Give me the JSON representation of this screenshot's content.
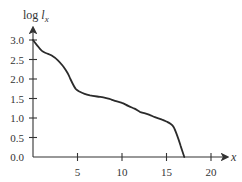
{
  "chart_data": {
    "type": "line",
    "title": "",
    "xlabel": "x",
    "ylabel": "log l_x",
    "ylabel_parts": {
      "prefix": "log ",
      "var": "l",
      "sub": "x"
    },
    "xlim": [
      0,
      20
    ],
    "ylim": [
      0.0,
      3.0
    ],
    "grid": false,
    "legend": null,
    "x_ticks": [
      5,
      10,
      15,
      20
    ],
    "x_tick_labels": [
      "5",
      "10",
      "15",
      "20"
    ],
    "y_ticks": [
      0.0,
      0.5,
      1.0,
      1.5,
      2.0,
      2.5,
      3.0
    ],
    "y_tick_labels": [
      "0.0",
      "0.5",
      "1.0",
      "1.5",
      "2.0",
      "2.5",
      "3.0"
    ],
    "series": [
      {
        "name": "log l_x",
        "color": "#2b2b2b",
        "x": [
          0,
          0.5,
          1.0,
          1.5,
          2.1,
          2.8,
          3.4,
          3.9,
          4.2,
          4.5,
          4.8,
          5.2,
          5.8,
          6.4,
          7.2,
          7.9,
          8.6,
          9.2,
          10.0,
          10.7,
          11.4,
          12.0,
          12.6,
          13.1,
          13.7,
          14.5,
          15.0,
          15.4,
          15.8,
          16.2,
          16.6,
          17.0
        ],
        "y": [
          3.0,
          2.85,
          2.72,
          2.66,
          2.6,
          2.48,
          2.32,
          2.15,
          2.0,
          1.86,
          1.75,
          1.68,
          1.62,
          1.58,
          1.55,
          1.53,
          1.49,
          1.44,
          1.39,
          1.31,
          1.24,
          1.16,
          1.12,
          1.08,
          1.02,
          0.96,
          0.91,
          0.86,
          0.77,
          0.55,
          0.28,
          0.0
        ]
      }
    ]
  },
  "layout": {
    "origin_px": [
      33,
      157
    ],
    "px_per_x": 8.9,
    "px_per_y": 39
  }
}
